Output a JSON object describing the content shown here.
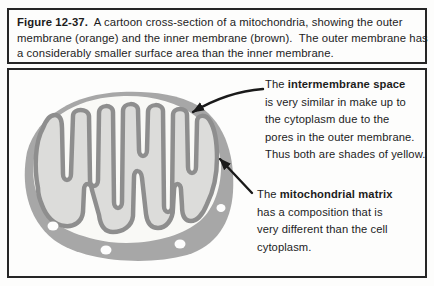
{
  "figure": {
    "caption": {
      "label": "Figure 12-37.",
      "line1_rest": "  A cartoon cross-section of a mitochondria, showing the outer",
      "line2": "membrane (orange) and the inner membrane (brown).  The outer membrane has",
      "line3": "a considerably smaller surface area than the inner membrane."
    },
    "annotations": [
      {
        "lead": "The",
        "term": "intermembrane space",
        "lines": [
          "is very similar in make up to",
          "the cytoplasm due to the",
          "pores in the outer membrane.",
          "Thus both are shades of yellow."
        ]
      },
      {
        "lead": "The",
        "term": "mitochondrial matrix",
        "lines": [
          "has a composition that is",
          "very different than the cell",
          "cytoplasm."
        ]
      }
    ]
  },
  "diagram": {
    "parts": [
      "outer membrane",
      "inner membrane",
      "intermembrane space",
      "mitochondrial matrix",
      "pores"
    ],
    "colors": {
      "outer_membrane": "#a7a7a7",
      "inner_membrane": "#8e8e8e",
      "matrix": "#dcdcda",
      "intermembrane_space": "#f9f9f6",
      "pore": "#fdfdfd",
      "arrow": "#1a1a1a",
      "border": "#262626",
      "background": "#fdfdfc"
    }
  }
}
